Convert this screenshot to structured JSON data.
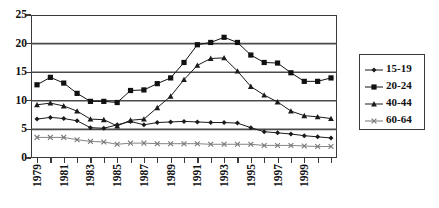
{
  "chart_data": {
    "type": "line",
    "title": "",
    "xlabel": "",
    "ylabel": "",
    "ylim": [
      0,
      25
    ],
    "yticks": [
      0,
      5,
      10,
      15,
      20,
      25
    ],
    "grid": "horizontal",
    "legend_position": "right",
    "x": [
      1979,
      1980,
      1981,
      1982,
      1983,
      1984,
      1985,
      1986,
      1987,
      1988,
      1989,
      1990,
      1991,
      1992,
      1993,
      1994,
      1995,
      1996,
      1997,
      1998,
      1999,
      2000,
      2001
    ],
    "xtick_labels": [
      "1979",
      "1981",
      "1983",
      "1985",
      "1987",
      "1989",
      "1991",
      "1993",
      "1995",
      "1997",
      "1999"
    ],
    "xtick_label_years": [
      1979,
      1981,
      1983,
      1985,
      1987,
      1989,
      1991,
      1993,
      1995,
      1997,
      1999
    ],
    "series": [
      {
        "name": "15-19",
        "marker": "diamond",
        "color": "#1a1a1a",
        "values": [
          6.8,
          7.1,
          6.9,
          6.5,
          5.3,
          5.2,
          5.8,
          6.4,
          5.8,
          6.2,
          6.3,
          6.4,
          6.3,
          6.2,
          6.2,
          6.1,
          5.3,
          4.6,
          4.4,
          4.2,
          3.9,
          3.7,
          3.5
        ]
      },
      {
        "name": "20-24",
        "marker": "square",
        "color": "#111111",
        "values": [
          12.8,
          14.1,
          13.1,
          11.3,
          9.9,
          9.9,
          9.7,
          11.8,
          11.9,
          13.0,
          14.0,
          16.7,
          19.8,
          20.2,
          21.1,
          20.2,
          18.0,
          16.7,
          16.6,
          14.9,
          13.4,
          13.4,
          14.0
        ]
      },
      {
        "name": "40-44",
        "marker": "triangle",
        "color": "#1a1a1a",
        "values": [
          9.3,
          9.6,
          9.1,
          8.2,
          6.8,
          6.7,
          5.6,
          6.6,
          6.8,
          8.8,
          10.8,
          13.7,
          16.2,
          17.4,
          17.5,
          15.2,
          12.5,
          11.0,
          9.8,
          8.2,
          7.4,
          7.2,
          6.9
        ]
      },
      {
        "name": "60-64",
        "marker": "x",
        "color": "#777777",
        "values": [
          3.6,
          3.6,
          3.6,
          3.2,
          2.9,
          2.8,
          2.4,
          2.6,
          2.6,
          2.5,
          2.5,
          2.5,
          2.5,
          2.4,
          2.4,
          2.4,
          2.4,
          2.2,
          2.2,
          2.2,
          2.1,
          2.0,
          2.0
        ]
      }
    ]
  },
  "legend": {
    "items": [
      {
        "label": "15-19"
      },
      {
        "label": "20-24"
      },
      {
        "label": "40-44"
      },
      {
        "label": "60-64"
      }
    ]
  },
  "colors": {
    "axis": "#3a3a3a",
    "gridline": "#4a4a4a",
    "background": "#ffffff",
    "text": "#111111"
  }
}
